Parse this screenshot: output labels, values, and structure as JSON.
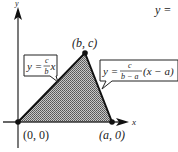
{
  "diagram": {
    "type": "triangle-region-on-coordinate-axes",
    "axes": {
      "x_label": "x",
      "y_label": "y"
    },
    "vertices": [
      {
        "name": "origin",
        "label": "(0, 0)"
      },
      {
        "name": "apex",
        "label": "(b, c)"
      },
      {
        "name": "base-right",
        "label": "(a, 0)"
      }
    ],
    "callouts": {
      "left_line": {
        "lhs": "y =",
        "num": "c",
        "den": "b",
        "rhs": "x"
      },
      "right_line": {
        "lhs": "y =",
        "num": "c",
        "den": "b − a",
        "rhs": "(x − a)"
      }
    },
    "top_right_fragment": "y ="
  },
  "colors": {
    "fill_region": "#9a9a9a",
    "lines": "#1a1a1a",
    "background": "#ffffff"
  }
}
